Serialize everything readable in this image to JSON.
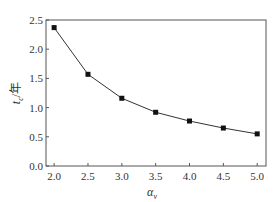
{
  "chart_data": {
    "type": "line",
    "title": "",
    "xlabel": "α_v",
    "xlabel_main": "α",
    "xlabel_sub": "v",
    "ylabel": "t_c/年",
    "ylabel_main": "t",
    "ylabel_sub": "c",
    "ylabel_unit": "/年",
    "x": [
      2.0,
      2.5,
      3.0,
      3.5,
      4.0,
      4.5,
      5.0
    ],
    "series": [
      {
        "name": "t_c",
        "values": [
          2.37,
          1.57,
          1.16,
          0.92,
          0.77,
          0.65,
          0.55
        ],
        "marker": "square",
        "color": "#111111"
      }
    ],
    "xlim": [
      1.88,
      5.13
    ],
    "ylim": [
      0.0,
      2.5
    ],
    "xticks": [
      "2.0",
      "2.5",
      "3.0",
      "3.5",
      "4.0",
      "4.5",
      "5.0"
    ],
    "yticks": [
      "0.0",
      "0.5",
      "1.0",
      "1.5",
      "2.0",
      "2.5"
    ],
    "grid": false,
    "legend": null
  }
}
